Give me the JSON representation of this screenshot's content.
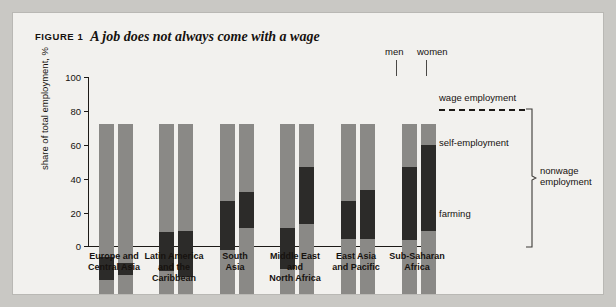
{
  "figure": {
    "label": "FIGURE 1",
    "title": "A job does not always come with a wage"
  },
  "axis": {
    "y_title": "share of total employment, %",
    "y_ticks": [
      "100",
      "80",
      "60",
      "40",
      "20",
      "0"
    ]
  },
  "annotations": {
    "men": "men",
    "women": "women"
  },
  "legend": {
    "wage": "wage employment",
    "self": "self-employment",
    "farming": "farming",
    "nonwage_line1": "nonwage",
    "nonwage_line2": "employment"
  },
  "colors": {
    "wage": "#8a8986",
    "self": "#2c2b29",
    "farming": "#8a8986",
    "card": "#f2f1ee",
    "page": "#c9c8c4",
    "ink": "#16120f"
  },
  "chart_data": {
    "type": "bar",
    "title": "A job does not always come with a wage",
    "xlabel": "",
    "ylabel": "share of total employment, %",
    "ylim": [
      0,
      100
    ],
    "stacked": true,
    "grid": false,
    "legend_position": "right",
    "categories": [
      "Europe and Central Asia",
      "Latin America and the Caribbean",
      "South Asia",
      "Middle East and North Africa",
      "East Asia and Pacific",
      "Sub-Saharan Africa"
    ],
    "subgroups": [
      "men",
      "women"
    ],
    "segments": [
      "farming",
      "self-employment",
      "wage employment"
    ],
    "series": [
      {
        "name": "farming",
        "men": [
          8.5,
          13.5,
          26.0,
          15.0,
          32.5,
          32.0
        ],
        "women": [
          11.0,
          10.0,
          39.0,
          41.0,
          32.5,
          37.0
        ]
      },
      {
        "name": "self-employment",
        "men": [
          13.0,
          23.0,
          29.0,
          24.0,
          22.0,
          42.5
        ],
        "women": [
          7.5,
          27.0,
          21.0,
          34.0,
          28.5,
          50.5
        ]
      },
      {
        "name": "wage employment",
        "men": [
          78.5,
          63.5,
          45.0,
          61.0,
          45.5,
          25.5
        ],
        "women": [
          81.5,
          63.0,
          40.0,
          25.0,
          39.0,
          12.5
        ]
      }
    ],
    "cumulative_tops": {
      "farming": {
        "men": [
          8.5,
          13.5,
          26,
          15,
          32.5,
          32
        ],
        "women": [
          11,
          10,
          39,
          41,
          32.5,
          37
        ]
      },
      "self_employment": {
        "men": [
          21.5,
          36.5,
          55,
          39,
          54.5,
          74.5
        ],
        "women": [
          18.5,
          37,
          60,
          75,
          61,
          87.5
        ]
      }
    },
    "category_labels_wrapped": [
      [
        "Europe and",
        "Central Asia"
      ],
      [
        "Latin America",
        "and the",
        "Caribbean"
      ],
      [
        "South",
        "Asia"
      ],
      [
        "Middle East",
        "and",
        "North Africa"
      ],
      [
        "East Asia",
        "and Pacific"
      ],
      [
        "Sub-Saharan",
        "Africa"
      ]
    ]
  }
}
